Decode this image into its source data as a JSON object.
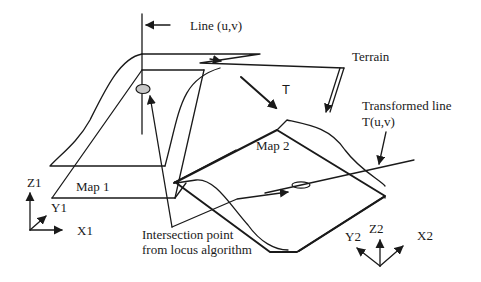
{
  "diagram": {
    "labels": {
      "line_uv": "Line (u,v)",
      "terrain": "Terrain",
      "transform": "T",
      "transformed_line_1": "Transformed line",
      "transformed_line_2": "T(u,v)",
      "map1": "Map 1",
      "map2": "Map 2",
      "intersection_1": "Intersection point",
      "intersection_2": "from locus algorithm",
      "axes1": {
        "z": "Z1",
        "y": "Y1",
        "x": "X1"
      },
      "axes2": {
        "z": "Z2",
        "y": "Y2",
        "x": "X2"
      }
    },
    "colors": {
      "stroke": "#1a1a1a",
      "intersection_marker_fill": "#c8c8c8",
      "background": "#ffffff"
    }
  }
}
